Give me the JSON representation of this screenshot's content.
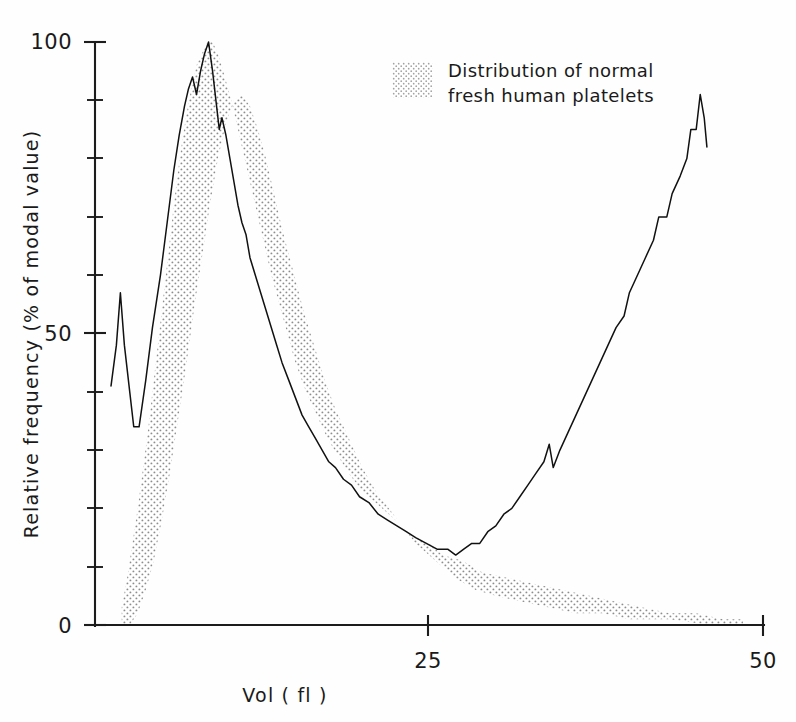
{
  "chart_data": {
    "type": "line",
    "title": "",
    "xlabel": "Vol  ( fl )",
    "ylabel": "Relative frequency (% of modal value)",
    "xlim": [
      0,
      50
    ],
    "ylim": [
      0,
      100
    ],
    "x_ticks": [
      25,
      50
    ],
    "x_tick_labels": [
      "25",
      "50"
    ],
    "y_ticks": [
      0,
      50,
      100
    ],
    "y_tick_labels": [
      "0",
      "50",
      "100"
    ],
    "y_minor_ticks": [
      10,
      20,
      30,
      40,
      60,
      70,
      80,
      90
    ],
    "grid": false,
    "legend_position": "top-right",
    "legend": [
      {
        "label_line1": "Distribution of normal",
        "label_line2": "fresh human platelets",
        "swatch": "stipple",
        "color": "#9a9a9a"
      }
    ],
    "series": [
      {
        "name": "measured sample",
        "style": "solid-line",
        "color": "#111111",
        "points": [
          [
            1.2,
            41
          ],
          [
            1.6,
            48
          ],
          [
            1.9,
            57
          ],
          [
            2.2,
            48
          ],
          [
            2.6,
            40
          ],
          [
            2.9,
            34
          ],
          [
            3.3,
            34
          ],
          [
            3.8,
            42
          ],
          [
            4.3,
            51
          ],
          [
            4.9,
            60
          ],
          [
            5.4,
            69
          ],
          [
            5.9,
            78
          ],
          [
            6.3,
            84
          ],
          [
            6.7,
            89
          ],
          [
            7.0,
            92
          ],
          [
            7.3,
            94
          ],
          [
            7.6,
            91
          ],
          [
            7.9,
            95
          ],
          [
            8.2,
            98
          ],
          [
            8.5,
            100
          ],
          [
            8.8,
            95
          ],
          [
            9.1,
            89
          ],
          [
            9.3,
            85
          ],
          [
            9.5,
            87
          ],
          [
            9.8,
            84
          ],
          [
            10.1,
            80
          ],
          [
            10.4,
            76
          ],
          [
            10.7,
            72
          ],
          [
            11.0,
            69
          ],
          [
            11.3,
            67
          ],
          [
            11.6,
            63
          ],
          [
            12.0,
            60
          ],
          [
            12.4,
            57
          ],
          [
            12.8,
            54
          ],
          [
            13.2,
            51
          ],
          [
            13.6,
            48
          ],
          [
            14.0,
            45
          ],
          [
            14.5,
            42
          ],
          [
            15.0,
            39
          ],
          [
            15.5,
            36
          ],
          [
            16.0,
            34
          ],
          [
            16.5,
            32
          ],
          [
            17.0,
            30
          ],
          [
            17.5,
            28
          ],
          [
            18.0,
            27
          ],
          [
            18.6,
            25
          ],
          [
            19.2,
            24
          ],
          [
            19.8,
            22
          ],
          [
            20.5,
            21
          ],
          [
            21.2,
            19
          ],
          [
            21.9,
            18
          ],
          [
            22.6,
            17
          ],
          [
            23.3,
            16
          ],
          [
            24.0,
            15
          ],
          [
            24.8,
            14
          ],
          [
            25.6,
            13
          ],
          [
            26.4,
            13
          ],
          [
            27.0,
            12
          ],
          [
            27.6,
            13
          ],
          [
            28.2,
            14
          ],
          [
            28.8,
            14
          ],
          [
            29.4,
            16
          ],
          [
            30.0,
            17
          ],
          [
            30.6,
            19
          ],
          [
            31.2,
            20
          ],
          [
            31.8,
            22
          ],
          [
            32.4,
            24
          ],
          [
            33.0,
            26
          ],
          [
            33.6,
            28
          ],
          [
            34.0,
            31
          ],
          [
            34.3,
            27
          ],
          [
            34.8,
            30
          ],
          [
            35.4,
            33
          ],
          [
            36.0,
            36
          ],
          [
            36.6,
            39
          ],
          [
            37.2,
            42
          ],
          [
            37.8,
            45
          ],
          [
            38.4,
            48
          ],
          [
            39.0,
            51
          ],
          [
            39.6,
            53
          ],
          [
            40.0,
            57
          ],
          [
            40.6,
            60
          ],
          [
            41.2,
            63
          ],
          [
            41.8,
            66
          ],
          [
            42.2,
            70
          ],
          [
            42.8,
            70
          ],
          [
            43.2,
            74
          ],
          [
            43.8,
            77
          ],
          [
            44.3,
            80
          ],
          [
            44.6,
            85
          ],
          [
            45.0,
            85
          ],
          [
            45.3,
            91
          ],
          [
            45.6,
            87
          ],
          [
            45.8,
            82
          ]
        ]
      }
    ],
    "band": {
      "name": "Distribution of normal fresh human platelets",
      "style": "stippled-area",
      "color": "#b9b9b9",
      "upper": [
        [
          2.0,
          3
        ],
        [
          2.4,
          8
        ],
        [
          2.8,
          14
        ],
        [
          3.2,
          20
        ],
        [
          3.6,
          27
        ],
        [
          4.0,
          34
        ],
        [
          4.4,
          42
        ],
        [
          4.8,
          50
        ],
        [
          5.2,
          58
        ],
        [
          5.6,
          66
        ],
        [
          6.0,
          74
        ],
        [
          6.4,
          81
        ],
        [
          6.8,
          87
        ],
        [
          7.2,
          92
        ],
        [
          7.6,
          96
        ],
        [
          8.0,
          98
        ],
        [
          8.4,
          100
        ],
        [
          8.8,
          100
        ],
        [
          9.2,
          98
        ],
        [
          9.6,
          95
        ],
        [
          10.2,
          90
        ],
        [
          10.8,
          84
        ],
        [
          11.4,
          78
        ],
        [
          12.0,
          72
        ],
        [
          12.6,
          66
        ],
        [
          13.2,
          60
        ],
        [
          13.8,
          55
        ],
        [
          14.4,
          50
        ],
        [
          15.0,
          45
        ],
        [
          15.8,
          40
        ],
        [
          16.6,
          36
        ],
        [
          17.4,
          32
        ],
        [
          18.2,
          29
        ],
        [
          19.0,
          26
        ],
        [
          20.0,
          23
        ],
        [
          21.0,
          21
        ],
        [
          22.0,
          19
        ],
        [
          23.0,
          17
        ],
        [
          24.0,
          15
        ],
        [
          25.0,
          14
        ],
        [
          26.0,
          12
        ],
        [
          27.5,
          11
        ],
        [
          29.0,
          9
        ],
        [
          31.0,
          8
        ],
        [
          33.0,
          7
        ],
        [
          35.0,
          6
        ],
        [
          37.0,
          5
        ],
        [
          39.0,
          4
        ],
        [
          41.0,
          3
        ],
        [
          43.0,
          2
        ],
        [
          45.0,
          2
        ],
        [
          47.0,
          1
        ],
        [
          48.5,
          1
        ]
      ],
      "lower": [
        [
          2.0,
          0
        ],
        [
          2.6,
          0
        ],
        [
          3.2,
          2
        ],
        [
          3.8,
          6
        ],
        [
          4.4,
          11
        ],
        [
          5.0,
          18
        ],
        [
          5.6,
          26
        ],
        [
          6.2,
          35
        ],
        [
          6.8,
          44
        ],
        [
          7.4,
          54
        ],
        [
          8.0,
          63
        ],
        [
          8.6,
          72
        ],
        [
          9.2,
          80
        ],
        [
          9.8,
          86
        ],
        [
          10.4,
          90
        ],
        [
          11.0,
          91
        ],
        [
          11.6,
          89
        ],
        [
          12.2,
          85
        ],
        [
          12.8,
          80
        ],
        [
          13.4,
          74
        ],
        [
          14.0,
          68
        ],
        [
          14.8,
          61
        ],
        [
          15.6,
          54
        ],
        [
          16.4,
          48
        ],
        [
          17.2,
          42
        ],
        [
          18.0,
          37
        ],
        [
          19.0,
          32
        ],
        [
          20.0,
          27
        ],
        [
          21.0,
          23
        ],
        [
          22.0,
          20
        ],
        [
          23.0,
          17
        ],
        [
          24.0,
          14
        ],
        [
          25.0,
          12
        ],
        [
          26.0,
          10
        ],
        [
          27.0,
          8
        ],
        [
          28.5,
          6
        ],
        [
          30.0,
          5
        ],
        [
          32.0,
          4
        ],
        [
          34.0,
          3
        ],
        [
          36.0,
          2
        ],
        [
          38.0,
          2
        ],
        [
          40.0,
          1
        ],
        [
          43.0,
          1
        ],
        [
          46.0,
          0
        ],
        [
          48.5,
          0
        ]
      ]
    }
  },
  "axes": {
    "y_label": "Relative frequency (% of modal value)",
    "x_label": "Vol  ( fl )",
    "y_top_label": "100",
    "y_mid_label": "50",
    "y_zero_label": "0",
    "x_mid_label": "25",
    "x_max_label": "50"
  },
  "legend": {
    "line1": "Distribution of normal",
    "line2": "fresh human platelets"
  }
}
